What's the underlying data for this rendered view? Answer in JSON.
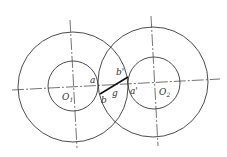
{
  "diagram": {
    "colors": {
      "line": "#3a3a3a",
      "action_line": "#111111",
      "background": "#ffffff"
    },
    "circles": [
      {
        "name": "O1",
        "cx": 73,
        "cy": 86,
        "outer_r": 55,
        "inner_r": 25
      },
      {
        "name": "O2",
        "cx": 154,
        "cy": 82,
        "outer_r": 55,
        "inner_r": 26
      }
    ],
    "labels": {
      "o1": "O",
      "o1_sub": "1",
      "o2": "O",
      "o2_sub": "2",
      "a": "a",
      "b": "b",
      "g": "g",
      "a_prime": "a'",
      "b_prime": "b'"
    }
  }
}
